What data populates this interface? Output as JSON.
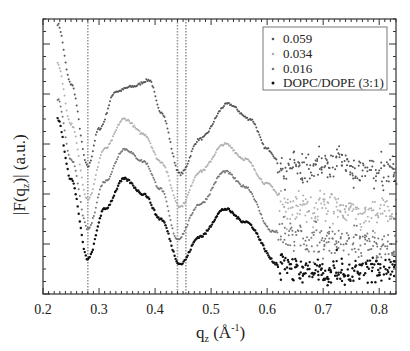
{
  "chart_data": {
    "type": "scatter",
    "title": "",
    "xlabel": "q_z (Å^-1)",
    "ylabel": "|F(q_z)| (a.u.)",
    "xlim": [
      0.2,
      0.83
    ],
    "ylim": [
      0,
      11
    ],
    "x_ticks": [
      0.2,
      0.3,
      0.4,
      0.5,
      0.6,
      0.7,
      0.8
    ],
    "x_tick_labels": [
      "0.2",
      "0.3",
      "0.4",
      "0.5",
      "0.6",
      "0.7",
      "0.8"
    ],
    "y_tick_labels_shown": false,
    "grid": false,
    "legend_position": "upper right",
    "vertical_dashed_lines_x": [
      0.28,
      0.44,
      0.455
    ],
    "series": [
      {
        "name": "0.059",
        "color": "#555555",
        "x": [
          0.226,
          0.25,
          0.28,
          0.3,
          0.33,
          0.36,
          0.39,
          0.41,
          0.445,
          0.48,
          0.53,
          0.57,
          0.6,
          0.63,
          0.66,
          0.7,
          0.73,
          0.76,
          0.8,
          0.83
        ],
        "values": [
          10.8,
          8.4,
          5.1,
          6.6,
          8.1,
          8.3,
          8.56,
          7.3,
          4.8,
          6.2,
          7.6,
          7.0,
          5.8,
          5.0,
          4.9,
          5.1,
          5.3,
          4.9,
          4.9,
          4.9
        ]
      },
      {
        "name": "0.034",
        "color": "#b0b0b0",
        "x": [
          0.226,
          0.25,
          0.28,
          0.31,
          0.345,
          0.38,
          0.41,
          0.445,
          0.48,
          0.525,
          0.56,
          0.6,
          0.64,
          0.67,
          0.7,
          0.73,
          0.76,
          0.8,
          0.83
        ],
        "values": [
          9.2,
          6.8,
          3.8,
          5.8,
          7.0,
          6.4,
          5.3,
          3.5,
          4.9,
          6.0,
          5.4,
          4.4,
          3.4,
          3.4,
          3.6,
          3.5,
          3.1,
          3.3,
          3.4
        ]
      },
      {
        "name": "0.016",
        "color": "#777777",
        "x": [
          0.226,
          0.25,
          0.28,
          0.31,
          0.345,
          0.38,
          0.41,
          0.44,
          0.48,
          0.525,
          0.56,
          0.61,
          0.65,
          0.7,
          0.75,
          0.8,
          0.83
        ],
        "values": [
          7.8,
          5.4,
          2.6,
          4.5,
          5.8,
          5.3,
          4.2,
          2.2,
          3.6,
          4.9,
          4.3,
          2.5,
          2.2,
          2.1,
          2.0,
          1.9,
          2.0
        ]
      },
      {
        "name": "DOPC/DOPE (3:1)",
        "color": "#111111",
        "x": [
          0.226,
          0.25,
          0.28,
          0.31,
          0.345,
          0.38,
          0.41,
          0.445,
          0.48,
          0.525,
          0.56,
          0.62,
          0.66,
          0.7,
          0.75,
          0.8,
          0.83
        ],
        "values": [
          7.0,
          4.6,
          1.4,
          3.4,
          4.6,
          4.0,
          3.0,
          1.2,
          2.3,
          3.4,
          2.9,
          1.2,
          0.9,
          0.9,
          0.9,
          0.9,
          1.0
        ]
      }
    ]
  },
  "legend": {
    "items": [
      "0.059",
      "0.034",
      "0.016",
      "DOPC/DOPE (3:1)"
    ]
  },
  "axes": {
    "x_label_main": "q",
    "x_label_sub": "z",
    "x_label_unit": " (Å",
    "x_label_sup": "-1",
    "x_label_close": ")",
    "y_label_pre": "|F(q",
    "y_label_sub": "z",
    "y_label_post": ")| (a.u.)"
  }
}
